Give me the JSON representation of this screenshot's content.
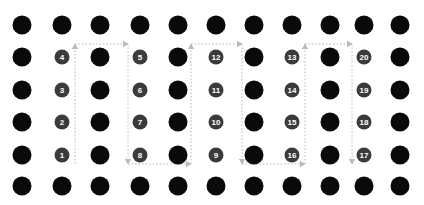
{
  "figure": {
    "title": "",
    "canvas": {
      "width": 424,
      "height": 205,
      "background": "#ffffff"
    }
  },
  "grid": {
    "columns": 11,
    "rows": 6,
    "col_x": [
      22,
      62,
      100,
      140,
      178,
      216,
      254,
      292,
      330,
      364,
      400
    ],
    "row_y": [
      25,
      57,
      90,
      122,
      155,
      186
    ],
    "dot_radius": 9.5,
    "dot_color": "#0a0a0a"
  },
  "markers": {
    "radius": 7.5,
    "fill": "#3b3b3b",
    "text_color": "#ffffff",
    "items": [
      {
        "label": "1",
        "col": 1,
        "row": 4
      },
      {
        "label": "2",
        "col": 1,
        "row": 3
      },
      {
        "label": "3",
        "col": 1,
        "row": 2
      },
      {
        "label": "4",
        "col": 1,
        "row": 1
      },
      {
        "label": "5",
        "col": 3,
        "row": 1
      },
      {
        "label": "6",
        "col": 3,
        "row": 2
      },
      {
        "label": "7",
        "col": 3,
        "row": 3
      },
      {
        "label": "8",
        "col": 3,
        "row": 4
      },
      {
        "label": "9",
        "col": 5,
        "row": 4
      },
      {
        "label": "10",
        "col": 5,
        "row": 3
      },
      {
        "label": "11",
        "col": 5,
        "row": 2
      },
      {
        "label": "12",
        "col": 5,
        "row": 1
      },
      {
        "label": "13",
        "col": 7,
        "row": 1
      },
      {
        "label": "14",
        "col": 7,
        "row": 2
      },
      {
        "label": "15",
        "col": 7,
        "row": 3
      },
      {
        "label": "16",
        "col": 7,
        "row": 4
      },
      {
        "label": "17",
        "col": 9,
        "row": 4
      },
      {
        "label": "18",
        "col": 9,
        "row": 3
      },
      {
        "label": "19",
        "col": 9,
        "row": 2
      },
      {
        "label": "20",
        "col": 9,
        "row": 1
      }
    ]
  },
  "path": {
    "color": "#b9b9b9",
    "style": "dotted",
    "top_y": 44,
    "bottom_y": 164,
    "lanes_x": [
      75,
      128,
      191,
      242,
      305,
      352
    ],
    "segments": [
      {
        "name": "up-lane-1",
        "x1": 75,
        "y1": 164,
        "x2": 75,
        "y2": 44,
        "arrow": "up"
      },
      {
        "name": "top-connector-1",
        "x1": 75,
        "y1": 44,
        "x2": 128,
        "y2": 44,
        "arrow": "right"
      },
      {
        "name": "down-lane-2",
        "x1": 128,
        "y1": 44,
        "x2": 128,
        "y2": 164,
        "arrow": "down"
      },
      {
        "name": "bottom-connector-1",
        "x1": 128,
        "y1": 164,
        "x2": 191,
        "y2": 164,
        "arrow": "right"
      },
      {
        "name": "up-lane-3",
        "x1": 191,
        "y1": 164,
        "x2": 191,
        "y2": 44,
        "arrow": "up"
      },
      {
        "name": "top-connector-2",
        "x1": 191,
        "y1": 44,
        "x2": 242,
        "y2": 44,
        "arrow": "right"
      },
      {
        "name": "down-lane-4",
        "x1": 242,
        "y1": 44,
        "x2": 242,
        "y2": 164,
        "arrow": "down"
      },
      {
        "name": "bottom-connector-2",
        "x1": 242,
        "y1": 164,
        "x2": 305,
        "y2": 164,
        "arrow": "right"
      },
      {
        "name": "up-lane-5",
        "x1": 305,
        "y1": 164,
        "x2": 305,
        "y2": 44,
        "arrow": "up"
      },
      {
        "name": "top-connector-3",
        "x1": 305,
        "y1": 44,
        "x2": 352,
        "y2": 44,
        "arrow": "right"
      },
      {
        "name": "down-lane-6",
        "x1": 352,
        "y1": 44,
        "x2": 352,
        "y2": 164,
        "arrow": "down"
      }
    ]
  }
}
